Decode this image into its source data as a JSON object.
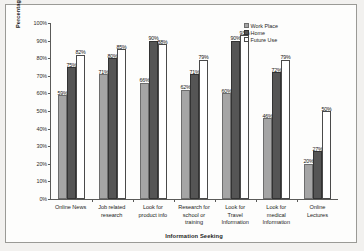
{
  "chart_data": {
    "type": "bar",
    "title": "",
    "xlabel": "Information Seeking",
    "ylabel": "Percentage of Users",
    "ylim": [
      0,
      100
    ],
    "ytick_labels": [
      "0%",
      "10%",
      "20%",
      "30%",
      "40%",
      "50%",
      "60%",
      "70%",
      "80%",
      "90%",
      "100%"
    ],
    "grid": false,
    "legend_position": "top-right",
    "categories": [
      "Online News",
      "Job related research",
      "Look for product info",
      "Research for school or training",
      "Look for Travel Information",
      "Look for medical Information",
      "Online Lectures"
    ],
    "category_lines": [
      [
        "Online News"
      ],
      [
        "Job related",
        "research"
      ],
      [
        "Look for",
        "product info"
      ],
      [
        "Research for",
        "school or",
        "training"
      ],
      [
        "Look for",
        "Travel",
        "Information"
      ],
      [
        "Look for",
        "medical",
        "Information"
      ],
      [
        "Online",
        "Lectures"
      ]
    ],
    "series": [
      {
        "name": "Work Place",
        "color": "#a5a5a5",
        "values": [
          59,
          71,
          66,
          62,
          60,
          46,
          20
        ],
        "labels": [
          "59%",
          "71%",
          "66%",
          "62%",
          "60%",
          "46%",
          "20%"
        ]
      },
      {
        "name": "Home",
        "color": "#555555",
        "values": [
          75,
          80,
          90,
          71,
          90,
          72,
          27
        ],
        "labels": [
          "75%",
          "80%",
          "90%",
          "71%",
          "90%",
          "72%",
          "27%"
        ]
      },
      {
        "name": "Future Use",
        "color": "#ffffff",
        "values": [
          82,
          85,
          88,
          79,
          93,
          79,
          50
        ],
        "labels": [
          "82%",
          "85%",
          "88%",
          "79%",
          "93%",
          "79%",
          "50%"
        ]
      }
    ]
  },
  "legend": {
    "items": [
      {
        "label": "Work Place",
        "swatch": "work"
      },
      {
        "label": "Home",
        "swatch": "home"
      },
      {
        "label": "Future Use",
        "swatch": "future"
      }
    ]
  }
}
